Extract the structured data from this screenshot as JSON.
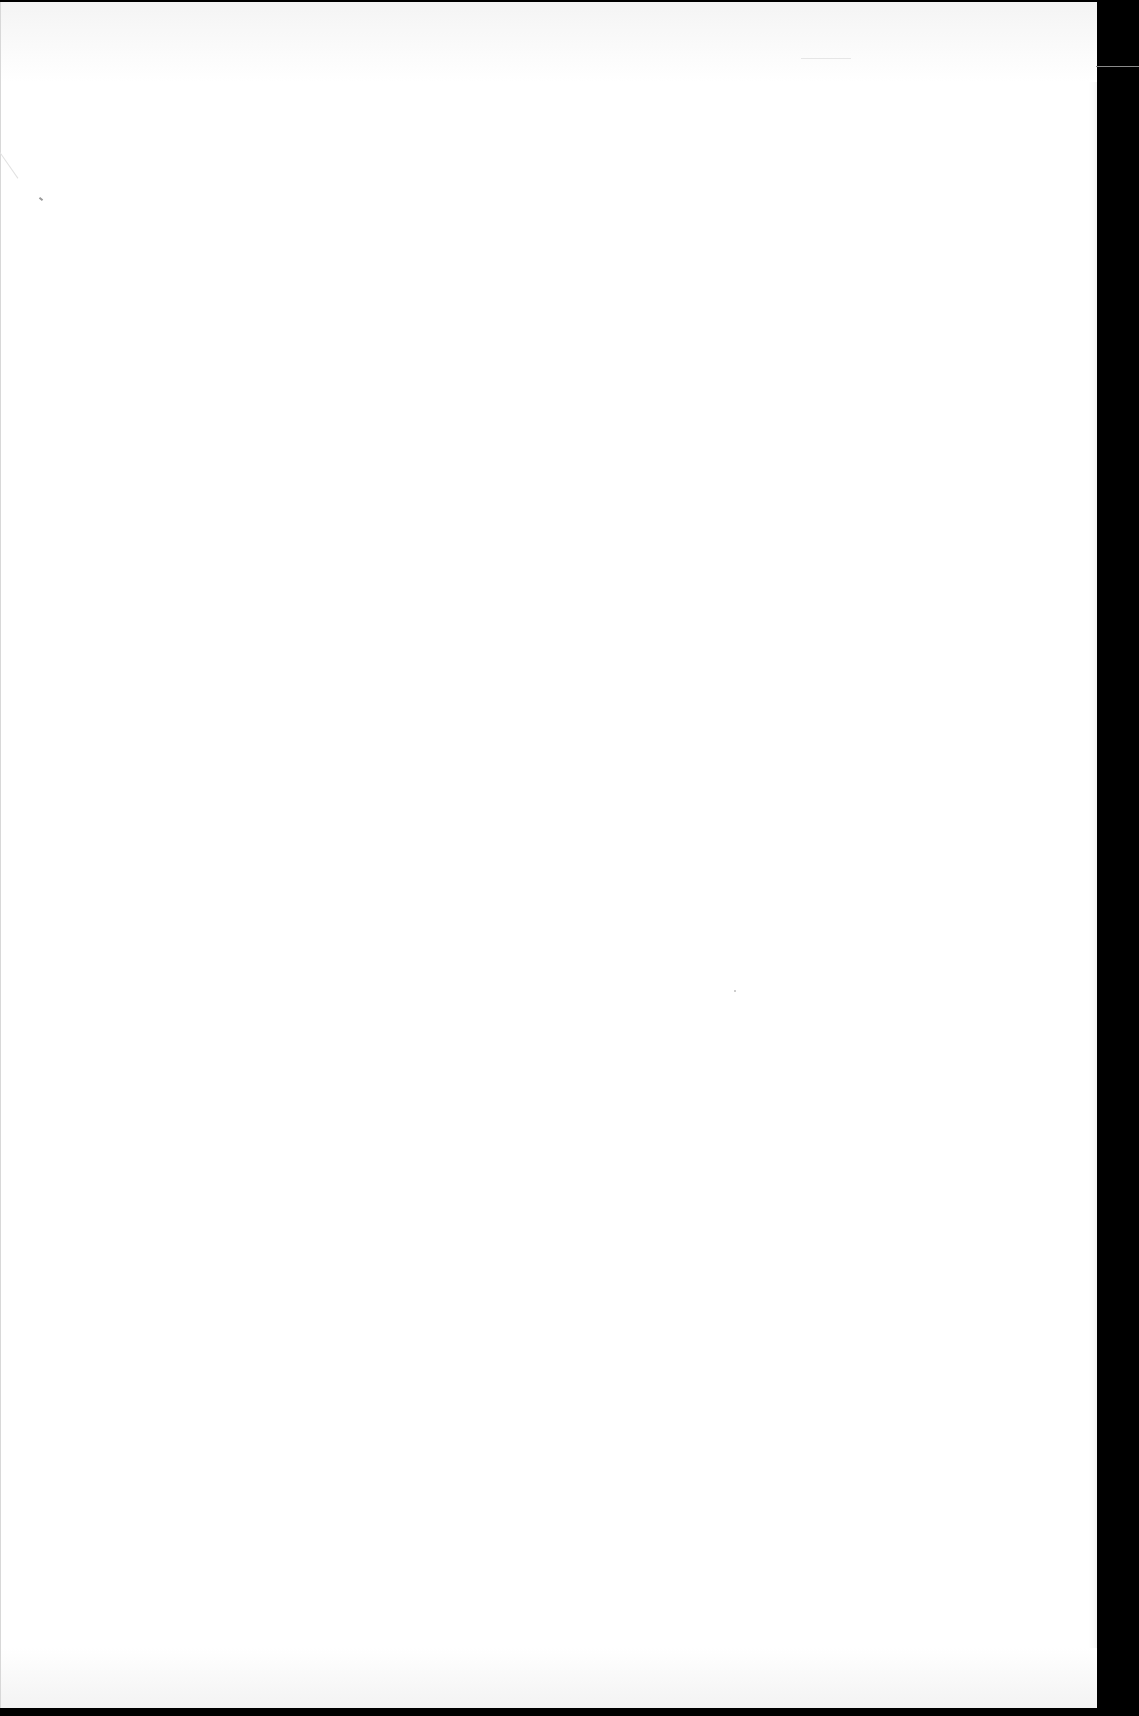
{
  "document": {
    "type": "scanned-page",
    "content": "",
    "colors": {
      "paper": "#ffffff",
      "scanner_background": "#000000",
      "scanner_line": "#8a8a8a"
    }
  }
}
